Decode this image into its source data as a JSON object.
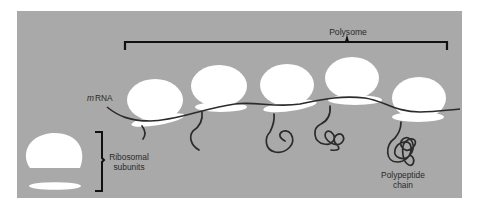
{
  "diagram": {
    "title": "Polysome",
    "labels": {
      "mrna_prefix": "m",
      "mrna_suffix": "RNA",
      "ribosomal_line1": "Ribosomal",
      "ribosomal_line2": "subunits",
      "polypeptide_line1": "Polypeptide",
      "polypeptide_line2": "chain"
    },
    "colors": {
      "panel": "#a9a9a9",
      "subunit": "#ffffff",
      "line": "#2b2b2b",
      "bracket": "#111111"
    },
    "ribosome_count": 5,
    "free_subunits": [
      "large subunit",
      "small subunit"
    ]
  }
}
